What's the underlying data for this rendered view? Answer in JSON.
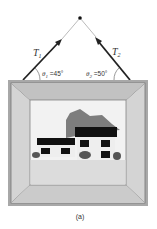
{
  "figure": {
    "caption": "(a)"
  },
  "labels": {
    "tension_left": "T",
    "tension_left_sub": "1",
    "tension_right": "T",
    "tension_right_sub": "2",
    "angle_left": "θ",
    "angle_left_sub": "1",
    "angle_left_value": " =45°",
    "angle_right": "θ",
    "angle_right_sub": "2",
    "angle_right_value": " =50°"
  },
  "colors": {
    "rope_arrow": "#222222",
    "rope_thin": "#bbbbbb",
    "frame_outer": "#9a9a9a",
    "frame_fill": "#cfcfcf",
    "mat": "#d9d9d9",
    "sky": "#f2f2f2",
    "ground": "#dcdcdc",
    "trees": "#7a7a7a",
    "roof": "#111111",
    "house_wall": "#eeeeee"
  }
}
